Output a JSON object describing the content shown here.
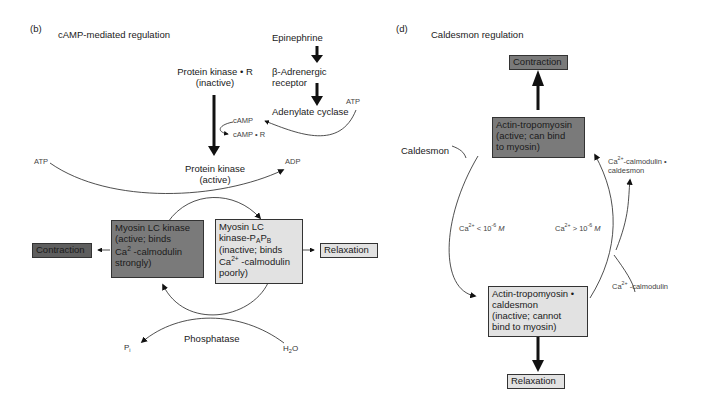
{
  "panel_b": {
    "label": "(b)",
    "title": "cAMP-mediated regulation",
    "epinephrine": "Epinephrine",
    "receptor_line1": "β-Adrenergic",
    "receptor_line2": "receptor",
    "adenylate_cyclase": "Adenylate cyclase",
    "atp_top": "ATP",
    "pk_r_line1": "Protein kinase • R",
    "pk_r_line2": "(inactive)",
    "camp": "cAMP",
    "camp_r": "cAMP • R",
    "atp_left": "ATP",
    "adp": "ADP",
    "pk_active_line1": "Protein kinase",
    "pk_active_line2": "(active)",
    "mlck_active": [
      "Myosin LC kinase",
      "(active; binds",
      "Ca",
      "2",
      " -calmodulin",
      "strongly)"
    ],
    "mlck_inactive": [
      "Myosin LC",
      "kinase-P",
      "A",
      "P",
      "B",
      "(inactive; binds",
      "Ca",
      "2+",
      " -calmodulin",
      "poorly)"
    ],
    "contraction": "Contraction",
    "relaxation": "Relaxation",
    "phosphatase": "Phosphatase",
    "pi": "P",
    "pi_sub": "i",
    "h2o_h": "H",
    "h2o_sub": "2",
    "h2o_o": "O"
  },
  "panel_d": {
    "label": "(d)",
    "title": "Caldesmon regulation",
    "contraction": "Contraction",
    "active_box": [
      "Actin-tropomyosin",
      "(active; can bind",
      "to myosin)"
    ],
    "caldesmon": "Caldesmon",
    "ca_cam_cald_1": "-calmodulin •",
    "ca_cam_cald_2": "caldesmon",
    "ca_low": " < 10",
    "ca_high": " > 10",
    "exp": "-6",
    "molar": "M",
    "ca": "Ca",
    "ca_sup": "2+",
    "ca_cam": " -calmodulin",
    "inactive_box": [
      "Actin-tropomyosin •",
      "caldesmon",
      "(inactive; cannot",
      "bind to myosin)"
    ],
    "relaxation": "Relaxation"
  },
  "colors": {
    "dark_box": "#7a7a7a",
    "light_box": "#e2e2e2"
  }
}
